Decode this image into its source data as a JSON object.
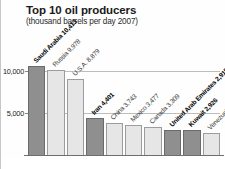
{
  "chart_data": {
    "type": "bar",
    "title": "Top 10 oil producers",
    "subtitle": "(thousand barrels per day 2007)",
    "xlabel": "",
    "ylabel": "",
    "ylim": [
      0,
      11500
    ],
    "grid": true,
    "legend": "none",
    "ytick_labels": [
      "10,000",
      "5,000"
    ],
    "ytick_values": [
      10000,
      5000
    ],
    "categories": [
      "Saudi Arabia",
      "Russia",
      "U.S.A.",
      "Iran",
      "China",
      "Mexico",
      "Canada",
      "United Arab Emirates",
      "Kuwait",
      "Venezuela"
    ],
    "values": [
      10413,
      9978,
      8879,
      4401,
      3743,
      3477,
      3309,
      2915,
      2926,
      2613
    ],
    "point_labels": [
      "Saudi Arabia 10,413",
      "Russia 9,978",
      "U.S.A. 8,879",
      "Iran 4,401",
      "China 3,743",
      "Mexico 3,477",
      "Canada 3,309",
      "United Arab Emirates 2,915",
      "Kuwait 2,926",
      "Venezuela 2,613"
    ],
    "series_groups": [
      "opec",
      "other",
      "other",
      "opec",
      "other",
      "other",
      "other",
      "opec",
      "opec",
      "other"
    ],
    "colors": {
      "opec": "#8f8f8f",
      "other": "#e6e6e6",
      "gridline": "#bdbdbd",
      "axis": "#6e6e6e",
      "text": "#1a1a1a"
    }
  }
}
